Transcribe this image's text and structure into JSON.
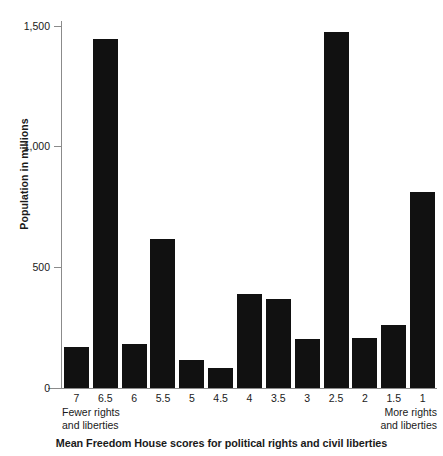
{
  "chart_data": {
    "type": "bar",
    "title": "",
    "xlabel": "Mean Freedom House scores for political rights and civil liberties",
    "ylabel": "Population in millions",
    "categories": [
      "7",
      "6.5",
      "6",
      "5.5",
      "5",
      "4.5",
      "4",
      "3.5",
      "3",
      "2.5",
      "2",
      "1.5",
      "1"
    ],
    "values": [
      170,
      1447,
      182,
      618,
      116,
      83,
      390,
      368,
      203,
      1477,
      207,
      262,
      814
    ],
    "ylim": [
      0,
      1550
    ],
    "yticks": [
      0,
      500,
      1000,
      1500
    ],
    "ytick_labels": [
      "0",
      "500",
      "1,000",
      "1,500"
    ],
    "grid": false,
    "legend": null,
    "bar_color": "#111111",
    "axis_color": "#8b8b8b",
    "annotations": {
      "left_anchor_line1": "Fewer rights",
      "left_anchor_line2": "and liberties",
      "right_anchor_line1": "More rights",
      "right_anchor_line2": "and liberties"
    }
  },
  "axes": {
    "y_title": "Population in millions",
    "x_title": "Mean Freedom House scores for political rights and civil liberties"
  }
}
